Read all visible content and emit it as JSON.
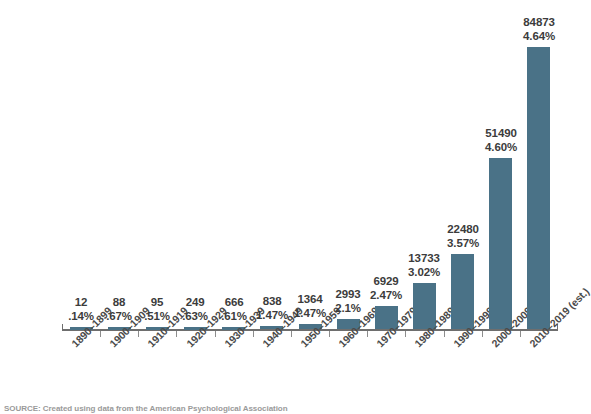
{
  "chart_data": {
    "type": "bar",
    "title": "",
    "subtitle": "",
    "xlabel": "",
    "ylabel": "",
    "ylim": [
      0,
      90000
    ],
    "grid": false,
    "legend": "none",
    "categories": [
      "1890–1899",
      "1900–1909",
      "1910–1919",
      "1920–1929",
      "1930–1939",
      "1940–1949",
      "1950–1959",
      "1960–1969",
      "1970–1979",
      "1980–1989",
      "1990–1999",
      "2000–2009",
      "2010–2019 (est.)"
    ],
    "values": [
      12,
      88,
      95,
      249,
      666,
      838,
      1364,
      2993,
      6929,
      13733,
      22480,
      51490,
      84873
    ],
    "percent_labels": [
      ".14%",
      ".67%",
      ".51%",
      ".63%",
      ".61%",
      "1.47%",
      "1.47%",
      "2.1%",
      "2.47%",
      "3.02%",
      "3.57%",
      "4.60%",
      "4.64%"
    ],
    "count_labels": [
      "12",
      "88",
      "95",
      "249",
      "666",
      "838",
      "1364",
      "2993",
      "6929",
      "13733",
      "22480",
      "51490",
      "84873"
    ],
    "bar_color": "#4a7287",
    "axis_color": "#6e6e6e",
    "text_color": "#3c3c3c"
  },
  "source": {
    "note": "SOURCE: Created using data from the American Psychological Association"
  }
}
